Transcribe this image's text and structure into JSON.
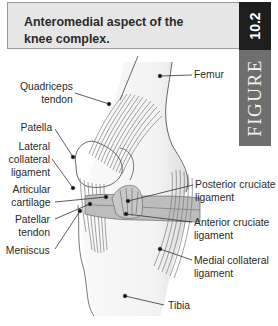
{
  "figure": {
    "title": "Anteromedial aspect of the knee complex.",
    "number": "10.2",
    "tab_label": "FIGURE",
    "colors": {
      "header_bg": "#e6e6e6",
      "number_tab_bg": "#1e1e1e",
      "figure_tab_bg": "#6e6e6e",
      "ligament_fill": "#b8b8b8",
      "bone_fill": "#f4f4f4"
    }
  },
  "labels": {
    "left": [
      {
        "id": "quadriceps-tendon",
        "line1": "Quadriceps",
        "line2": "tendon"
      },
      {
        "id": "patella",
        "line1": "Patella",
        "line2": ""
      },
      {
        "id": "lateral-collateral-ligament",
        "line1": "Lateral",
        "line2": "collateral",
        "line3": "ligament"
      },
      {
        "id": "articular-cartilage",
        "line1": "Articular",
        "line2": "cartilage"
      },
      {
        "id": "patellar-tendon",
        "line1": "Patellar",
        "line2": "tendon"
      },
      {
        "id": "meniscus",
        "line1": "Meniscus",
        "line2": ""
      }
    ],
    "right": [
      {
        "id": "femur",
        "line1": "Femur",
        "line2": ""
      },
      {
        "id": "posterior-cruciate-ligament",
        "line1": "Posterior cruciate",
        "line2": "ligament"
      },
      {
        "id": "anterior-cruciate-ligament",
        "line1": "Anterior cruciate",
        "line2": "ligament"
      },
      {
        "id": "medial-collateral-ligament",
        "line1": "Medial collateral",
        "line2": "ligament"
      },
      {
        "id": "tibia",
        "line1": "Tibia",
        "line2": ""
      }
    ]
  }
}
